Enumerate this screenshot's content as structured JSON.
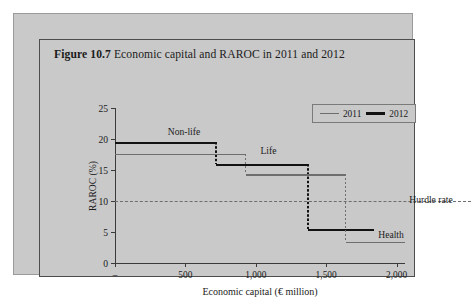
{
  "figure": {
    "number": "Figure 10.7",
    "caption": "Economic capital and RAROC in 2011 and 2012"
  },
  "chart_data": {
    "type": "line",
    "title": "Figure 10.7  Economic capital and RAROC in 2011 and 2012",
    "xlabel": "Economic capital (€ million)",
    "ylabel": "RAROC (%)",
    "xlim": [
      0,
      2060
    ],
    "ylim": [
      0,
      25
    ],
    "grid": false,
    "legend_position": "top-right",
    "xticks": [
      0,
      500,
      1000,
      1500,
      2000
    ],
    "xticklabels": [
      "–",
      "500",
      "1,000",
      "1,500",
      "2,000"
    ],
    "yticks": [
      0,
      5,
      10,
      15,
      20,
      25
    ],
    "yticklabels": [
      "0",
      "5",
      "10",
      "15",
      "20",
      "25"
    ],
    "legend": [
      {
        "name": "2011",
        "color": "#6e6e6e",
        "style": "thin-solid"
      },
      {
        "name": "2012",
        "color": "#121212",
        "style": "thick-solid"
      }
    ],
    "series": [
      {
        "name": "2012",
        "color": "#121212",
        "steps": [
          {
            "label": "Non-life",
            "raroc": 19.5,
            "x_start": 0,
            "x_end": 720
          },
          {
            "label": "Life",
            "raroc": 16.0,
            "x_start": 720,
            "x_end": 1370
          },
          {
            "label": "Health",
            "raroc": 5.5,
            "x_start": 1370,
            "x_end": 1840
          }
        ]
      },
      {
        "name": "2011",
        "color": "#6e6e6e",
        "steps": [
          {
            "label": "Non-life",
            "raroc": 17.6,
            "x_start": 0,
            "x_end": 930
          },
          {
            "label": "Life",
            "raroc": 14.3,
            "x_start": 930,
            "x_end": 1640
          },
          {
            "label": "Health",
            "raroc": 3.4,
            "x_start": 1640,
            "x_end": 2060
          }
        ]
      }
    ],
    "reference_lines": [
      {
        "label": "Hurdle rate",
        "value": 10,
        "orientation": "horizontal",
        "style": "dashed",
        "color": "#6e6e6e"
      }
    ],
    "annotations": [
      {
        "text": "Non-life",
        "x": 490,
        "y": 20.4,
        "anchor": "center"
      },
      {
        "text": "Life",
        "x": 1090,
        "y": 17.2,
        "anchor": "center"
      },
      {
        "text": "Hurdle rate",
        "x": 2090,
        "y": 10.3,
        "anchor": "left"
      },
      {
        "text": "Health",
        "x": 1870,
        "y": 4.6,
        "anchor": "left"
      }
    ]
  }
}
